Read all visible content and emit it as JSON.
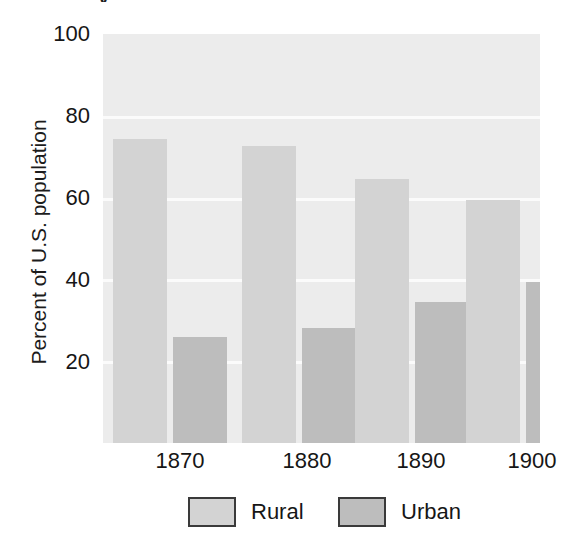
{
  "chart_data": {
    "type": "bar",
    "title": "",
    "cropped_title_remnant": "y",
    "xlabel": "",
    "ylabel": "Percent of U.S. population",
    "categories": [
      "1870",
      "1880",
      "1890",
      "1900"
    ],
    "series": [
      {
        "name": "Rural",
        "color": "#d3d3d3",
        "values": [
          74.3,
          72.6,
          64.6,
          59.5
        ]
      },
      {
        "name": "Urban",
        "color": "#bdbdbd",
        "values": [
          26.0,
          28.2,
          34.4,
          39.3
        ]
      }
    ],
    "ylim": [
      0,
      100
    ],
    "yticks": [
      100,
      80,
      60,
      40,
      20
    ],
    "ytick_labels": [
      "100",
      "80",
      "60",
      "40",
      "20"
    ],
    "grid": true,
    "gridline_color": "#fbfbfb",
    "plot_background": "#ececec",
    "legend_position": "bottom",
    "legend": [
      {
        "label": "Rural",
        "color": "#d3d3d3"
      },
      {
        "label": "Urban",
        "color": "#bdbdbd"
      }
    ]
  }
}
